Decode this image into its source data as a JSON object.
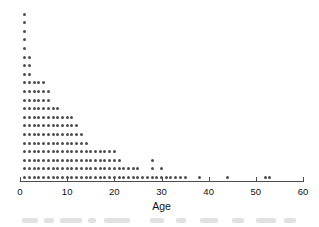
{
  "figure": {
    "type": "dotplot",
    "background": "#ffffff",
    "dot_color": "#4d4d4d",
    "axis_color": "#4d4d4d"
  },
  "axis": {
    "title": "Age",
    "min": 0,
    "max": 60,
    "tick_step": 10,
    "tick_labels": [
      "0",
      "10",
      "20",
      "30",
      "40",
      "50",
      "60"
    ],
    "tick_values": [
      0,
      10,
      20,
      30,
      40,
      50,
      60
    ]
  },
  "chart_data": {
    "type": "scatter",
    "title": "",
    "subtitle": "",
    "xlabel": "Age",
    "ylabel": "",
    "xlim": [
      0,
      60
    ],
    "grid": false,
    "legend": null,
    "plot_style": "stacked dot plot (each dot = one observation)",
    "categories": [
      1,
      2,
      3,
      4,
      5,
      6,
      7,
      8,
      9,
      10,
      11,
      12,
      13,
      14,
      15,
      16,
      17,
      18,
      19,
      20,
      21,
      22,
      23,
      24,
      25,
      26,
      27,
      28,
      29,
      30,
      31,
      32,
      33,
      34,
      35,
      38,
      44,
      52,
      53
    ],
    "values": [
      20,
      15,
      12,
      12,
      12,
      11,
      9,
      9,
      8,
      8,
      8,
      7,
      6,
      5,
      4,
      4,
      4,
      4,
      4,
      4,
      3,
      2,
      2,
      2,
      2,
      1,
      1,
      3,
      1,
      2,
      1,
      1,
      1,
      1,
      1,
      1,
      1,
      1,
      1
    ],
    "x": [
      1,
      2,
      3,
      4,
      5,
      6,
      7,
      8,
      9,
      10,
      11,
      12,
      13,
      14,
      15,
      16,
      17,
      18,
      19,
      20,
      21,
      22,
      23,
      24,
      25,
      26,
      27,
      28,
      29,
      30,
      31,
      32,
      33,
      34,
      35,
      38,
      44,
      52,
      53
    ],
    "counts": [
      20,
      15,
      12,
      12,
      12,
      11,
      9,
      9,
      8,
      8,
      8,
      7,
      6,
      5,
      4,
      4,
      4,
      4,
      4,
      4,
      3,
      2,
      2,
      2,
      2,
      1,
      1,
      3,
      1,
      2,
      1,
      1,
      1,
      1,
      1,
      1,
      1,
      1,
      1
    ],
    "total_observations": 218,
    "annotations": []
  },
  "geometry": {
    "x0_px": 20,
    "x60_px": 303,
    "baseline_y_px": 181,
    "row_spacing_px": 8.6,
    "dot_size_px": 3
  }
}
